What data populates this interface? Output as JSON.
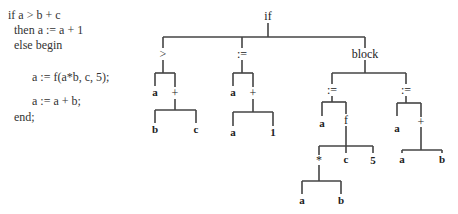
{
  "code": {
    "lines": [
      "if a > b + c",
      "  then a := a + 1",
      "  else begin",
      "        a := f(a*b, c, 5);",
      "        a := a + b;",
      "  end;"
    ]
  },
  "tree": {
    "root": "if",
    "nodes": {
      "if": "if",
      "gt": ">",
      "gt_a": "a",
      "gt_plus": "+",
      "gt_plus_b": "b",
      "gt_plus_c": "c",
      "assign1": ":=",
      "assign1_a": "a",
      "assign1_plus": "+",
      "assign1_plus_a": "a",
      "assign1_plus_1": "1",
      "block": "block",
      "assign2": ":=",
      "assign2_a": "a",
      "f": "f",
      "f_mul": "*",
      "f_mul_a": "a",
      "f_mul_b": "b",
      "f_c": "c",
      "f_5": "5",
      "assign3": ":=",
      "assign3_a": "a",
      "assign3_plus": "+",
      "assign3_plus_a": "a",
      "assign3_plus_b": "b"
    }
  }
}
